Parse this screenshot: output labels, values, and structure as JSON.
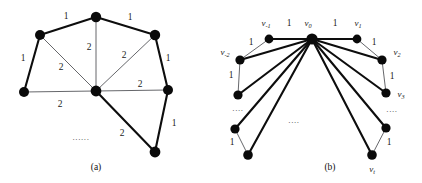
{
  "figure": {
    "width": 422,
    "height": 183,
    "background": "#ffffff",
    "node_color": "#0a0a0a",
    "thick_edge_color": "#0d0d0d",
    "thin_edge_color": "#55565a"
  },
  "panel_a": {
    "caption": "(a)",
    "caption_pos": {
      "x": 96,
      "y": 168
    },
    "ellipsis": "......",
    "ellipsis_pos": {
      "x": 81,
      "y": 137
    },
    "nodes": [
      {
        "id": "a-top",
        "x": 96,
        "y": 17,
        "r": 5.2
      },
      {
        "id": "a-upper-left",
        "x": 40,
        "y": 35,
        "r": 5.0
      },
      {
        "id": "a-upper-right",
        "x": 155,
        "y": 35,
        "r": 5.2
      },
      {
        "id": "a-left",
        "x": 24,
        "y": 92,
        "r": 5.0
      },
      {
        "id": "a-center",
        "x": 96,
        "y": 91,
        "r": 5.4
      },
      {
        "id": "a-right",
        "x": 168,
        "y": 90,
        "r": 5.0
      },
      {
        "id": "a-bottom",
        "x": 155,
        "y": 152,
        "r": 5.4
      }
    ],
    "edges": [
      {
        "from": "a-upper-left",
        "to": "a-top",
        "style": "thick",
        "weight": "1",
        "label_pos": {
          "x": 66,
          "y": 17
        }
      },
      {
        "from": "a-top",
        "to": "a-upper-right",
        "style": "thick",
        "weight": "1",
        "label_pos": {
          "x": 130,
          "y": 18
        }
      },
      {
        "from": "a-upper-left",
        "to": "a-left",
        "style": "thick",
        "weight": "1",
        "label_pos": {
          "x": 23,
          "y": 59
        }
      },
      {
        "from": "a-upper-right",
        "to": "a-right",
        "style": "thick",
        "weight": "1",
        "label_pos": {
          "x": 168,
          "y": 59
        }
      },
      {
        "from": "a-right",
        "to": "a-bottom",
        "style": "thick",
        "weight": "1",
        "label_pos": {
          "x": 174,
          "y": 124
        }
      },
      {
        "from": "a-center",
        "to": "a-bottom",
        "style": "thick",
        "weight": "2",
        "label_pos": {
          "x": 122,
          "y": 134
        }
      },
      {
        "from": "a-top",
        "to": "a-center",
        "style": "thin",
        "weight": "2",
        "label_pos": {
          "x": 89,
          "y": 48
        }
      },
      {
        "from": "a-upper-left",
        "to": "a-center",
        "style": "thin",
        "weight": "2",
        "label_pos": {
          "x": 61,
          "y": 68
        }
      },
      {
        "from": "a-upper-right",
        "to": "a-center",
        "style": "thin",
        "weight": "2",
        "label_pos": {
          "x": 124,
          "y": 56
        }
      },
      {
        "from": "a-left",
        "to": "a-center",
        "style": "thin",
        "weight": "2",
        "label_pos": {
          "x": 60,
          "y": 105
        }
      },
      {
        "from": "a-center",
        "to": "a-right",
        "style": "thin",
        "weight": "2",
        "label_pos": {
          "x": 140,
          "y": 85
        }
      }
    ]
  },
  "panel_b": {
    "caption": "(b)",
    "caption_pos": {
      "x": 330,
      "y": 168
    },
    "ellipses": [
      {
        "text": "....",
        "x": 238,
        "y": 108
      },
      {
        "text": "....",
        "x": 294,
        "y": 120
      },
      {
        "text": "....",
        "x": 392,
        "y": 109
      }
    ],
    "nodes": [
      {
        "id": "b-center",
        "x": 312,
        "y": 39,
        "r": 5.6,
        "label": "v",
        "sub": "0",
        "label_pos": {
          "x": 308,
          "y": 24
        }
      },
      {
        "id": "b-l1",
        "x": 269,
        "y": 39,
        "r": 4.4,
        "label": "v",
        "sub": "-1",
        "label_pos": {
          "x": 266,
          "y": 24
        }
      },
      {
        "id": "b-r1",
        "x": 357,
        "y": 39,
        "r": 4.4,
        "label": "v",
        "sub": "1",
        "label_pos": {
          "x": 358,
          "y": 24
        }
      },
      {
        "id": "b-l2",
        "x": 240,
        "y": 60,
        "r": 4.6,
        "label": "v",
        "sub": "-2",
        "label_pos": {
          "x": 225,
          "y": 53
        }
      },
      {
        "id": "b-r2",
        "x": 382,
        "y": 60,
        "r": 4.6,
        "label": "v",
        "sub": "2",
        "label_pos": {
          "x": 397,
          "y": 53
        }
      },
      {
        "id": "b-l3",
        "x": 238,
        "y": 95,
        "r": 4.6,
        "label": "",
        "sub": "",
        "label_pos": {
          "x": 0,
          "y": 0
        }
      },
      {
        "id": "b-r3",
        "x": 386,
        "y": 93,
        "r": 4.6,
        "label": "v",
        "sub": "3",
        "label_pos": {
          "x": 401,
          "y": 95
        }
      },
      {
        "id": "b-l4",
        "x": 235,
        "y": 129,
        "r": 4.6,
        "label": "",
        "sub": "",
        "label_pos": {
          "x": 0,
          "y": 0
        }
      },
      {
        "id": "b-r4",
        "x": 386,
        "y": 128,
        "r": 4.6,
        "label": "",
        "sub": "",
        "label_pos": {
          "x": 0,
          "y": 0
        }
      },
      {
        "id": "b-l5",
        "x": 248,
        "y": 155,
        "r": 4.8,
        "label": "",
        "sub": "",
        "label_pos": {
          "x": 0,
          "y": 0
        }
      },
      {
        "id": "b-r5",
        "x": 372,
        "y": 155,
        "r": 4.8,
        "label": "v",
        "sub": "t",
        "label_pos": {
          "x": 372,
          "y": 170
        }
      }
    ],
    "edges": [
      {
        "from": "b-center",
        "to": "b-l1",
        "style": "thick",
        "weight": "1",
        "label_pos": {
          "x": 289,
          "y": 24
        }
      },
      {
        "from": "b-center",
        "to": "b-r1",
        "style": "thick",
        "weight": "1",
        "label_pos": {
          "x": 335,
          "y": 24
        }
      },
      {
        "from": "b-center",
        "to": "b-l2",
        "style": "thick",
        "weight": "",
        "label_pos": {
          "x": 0,
          "y": 0
        }
      },
      {
        "from": "b-center",
        "to": "b-r2",
        "style": "thick",
        "weight": "",
        "label_pos": {
          "x": 0,
          "y": 0
        }
      },
      {
        "from": "b-center",
        "to": "b-l3",
        "style": "thick",
        "weight": "",
        "label_pos": {
          "x": 0,
          "y": 0
        }
      },
      {
        "from": "b-center",
        "to": "b-r3",
        "style": "thick",
        "weight": "",
        "label_pos": {
          "x": 0,
          "y": 0
        }
      },
      {
        "from": "b-center",
        "to": "b-l4",
        "style": "thick",
        "weight": "",
        "label_pos": {
          "x": 0,
          "y": 0
        }
      },
      {
        "from": "b-center",
        "to": "b-r4",
        "style": "thick",
        "weight": "",
        "label_pos": {
          "x": 0,
          "y": 0
        }
      },
      {
        "from": "b-center",
        "to": "b-l5",
        "style": "thick",
        "weight": "",
        "label_pos": {
          "x": 0,
          "y": 0
        }
      },
      {
        "from": "b-center",
        "to": "b-r5",
        "style": "thick",
        "weight": "",
        "label_pos": {
          "x": 0,
          "y": 0
        }
      },
      {
        "from": "b-l1",
        "to": "b-l2",
        "style": "thin",
        "weight": "1",
        "label_pos": {
          "x": 251,
          "y": 43
        }
      },
      {
        "from": "b-r1",
        "to": "b-r2",
        "style": "thin",
        "weight": "1",
        "label_pos": {
          "x": 374,
          "y": 43
        }
      },
      {
        "from": "b-l2",
        "to": "b-l3",
        "style": "thin",
        "weight": "1",
        "label_pos": {
          "x": 231,
          "y": 76
        }
      },
      {
        "from": "b-r2",
        "to": "b-r3",
        "style": "thin",
        "weight": "1",
        "label_pos": {
          "x": 392,
          "y": 77
        }
      },
      {
        "from": "b-l4",
        "to": "b-l5",
        "style": "thin",
        "weight": "1",
        "label_pos": {
          "x": 232,
          "y": 143
        }
      },
      {
        "from": "b-r4",
        "to": "b-r5",
        "style": "thin",
        "weight": "1",
        "label_pos": {
          "x": 389,
          "y": 143
        }
      }
    ]
  }
}
